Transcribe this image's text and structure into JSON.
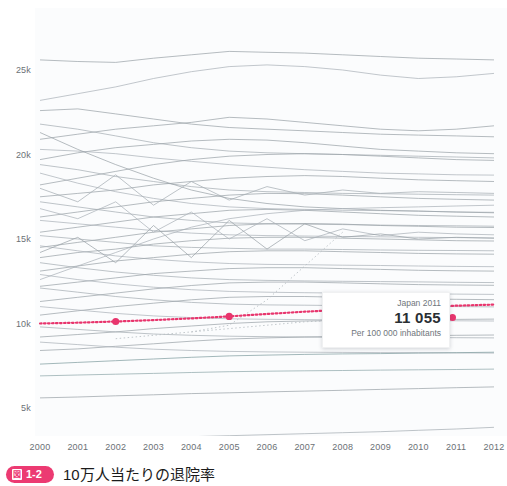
{
  "chart_data": {
    "type": "line",
    "title": "",
    "xlabel": "",
    "ylabel": "",
    "xlim": [
      2000,
      2012
    ],
    "ylim": [
      2000,
      26500
    ],
    "grid": false,
    "legend": false,
    "x": [
      2000,
      2001,
      2002,
      2003,
      2004,
      2005,
      2006,
      2007,
      2008,
      2009,
      2010,
      2011,
      2012
    ],
    "y_ticks": [
      {
        "label": "25k",
        "value": 25000
      },
      {
        "label": "20k",
        "value": 20000
      },
      {
        "label": "15k",
        "value": 15000
      },
      {
        "label": "10k",
        "value": 10000
      },
      {
        "label": "5k",
        "value": 5000
      }
    ],
    "x_ticks": [
      "2000",
      "2001",
      "2002",
      "2003",
      "2004",
      "2005",
      "2006",
      "2007",
      "2008",
      "2009",
      "2010",
      "2011",
      "2012"
    ],
    "highlight": {
      "name": "Japan",
      "color": "#e8356d",
      "style": "dotted",
      "values": [
        10000,
        10050,
        10120,
        10200,
        10300,
        10420,
        10560,
        10700,
        10810,
        10900,
        10980,
        11055,
        11120
      ]
    },
    "series": [
      {
        "name": "s1",
        "color": "#9aa2a8",
        "values": [
          25600,
          25500,
          25450,
          25700,
          25900,
          26100,
          26050,
          26000,
          25900,
          25800,
          25700,
          25650,
          25600
        ]
      },
      {
        "name": "s2",
        "color": "#aab2b8",
        "values": [
          23200,
          23600,
          24000,
          24500,
          24900,
          25200,
          25300,
          25200,
          25000,
          24700,
          24500,
          24600,
          24800
        ]
      },
      {
        "name": "s3",
        "color": "#9aa2a8",
        "values": [
          20900,
          21200,
          21500,
          21700,
          21900,
          22200,
          22100,
          21900,
          21700,
          21500,
          21400,
          21500,
          21700
        ]
      },
      {
        "name": "s4",
        "color": "#a5adb3",
        "values": [
          21800,
          21500,
          21100,
          20700,
          20400,
          20200,
          20100,
          20050,
          20000,
          19950,
          19900,
          19850,
          19800
        ]
      },
      {
        "name": "s5",
        "color": "#9aa2a8",
        "values": [
          19700,
          20100,
          20400,
          20600,
          20800,
          20900,
          20850,
          20700,
          20500,
          20300,
          20200,
          20100,
          20050
        ]
      },
      {
        "name": "s6",
        "color": "#aab2b8",
        "values": [
          20300,
          20200,
          20050,
          19800,
          19600,
          19400,
          19250,
          19100,
          19000,
          18900,
          18850,
          18800,
          18780
        ]
      },
      {
        "name": "s7",
        "color": "#9aa2a8",
        "values": [
          18200,
          18600,
          19000,
          19400,
          19700,
          19900,
          20000,
          20050,
          20000,
          19900,
          19800,
          19700,
          19650
        ]
      },
      {
        "name": "s8",
        "color": "#a5adb3",
        "values": [
          19400,
          19100,
          18700,
          18400,
          18100,
          17900,
          17800,
          17750,
          17700,
          17680,
          17650,
          17620,
          17600
        ]
      },
      {
        "name": "s9",
        "color": "#9aa2a8",
        "values": [
          17500,
          17700,
          17900,
          18200,
          18400,
          18600,
          18700,
          18750,
          18700,
          18600,
          18500,
          18450,
          18400
        ]
      },
      {
        "name": "s10",
        "color": "#aab2b8",
        "values": [
          18900,
          18300,
          17800,
          17400,
          17100,
          16900,
          16800,
          16750,
          16700,
          16680,
          16650,
          16600,
          16580
        ]
      },
      {
        "name": "s11",
        "color": "#9aa2a8",
        "values": [
          16300,
          16600,
          16900,
          17200,
          17400,
          17600,
          17700,
          17680,
          17600,
          17500,
          17400,
          17350,
          17300
        ]
      },
      {
        "name": "s12",
        "color": "#a5adb3",
        "values": [
          17200,
          16900,
          16600,
          16300,
          16100,
          15950,
          15900,
          15880,
          15850,
          15820,
          15800,
          15780,
          15760
        ]
      },
      {
        "name": "s13",
        "color": "#9aa2a8",
        "values": [
          15400,
          15700,
          16000,
          16300,
          16500,
          16700,
          16750,
          16700,
          16600,
          16500,
          16400,
          16350,
          16300
        ]
      },
      {
        "name": "s14",
        "color": "#aab2b8",
        "values": [
          16100,
          15900,
          15700,
          15500,
          15350,
          15250,
          15200,
          15180,
          15150,
          15130,
          15100,
          15080,
          15060
        ]
      },
      {
        "name": "s15",
        "color": "#9aa2a8",
        "values": [
          14500,
          14800,
          15100,
          15400,
          15600,
          15800,
          15900,
          15920,
          15880,
          15800,
          15750,
          15700,
          15680
        ]
      },
      {
        "name": "s16",
        "color": "#a5adb3",
        "values": [
          15200,
          15000,
          14800,
          14600,
          14500,
          14450,
          14400,
          14400,
          14380,
          14350,
          14330,
          14320,
          14300
        ]
      },
      {
        "name": "s17",
        "color": "#9aa2a8",
        "values": [
          13900,
          14200,
          14400,
          14700,
          14900,
          15050,
          15100,
          15100,
          15050,
          15000,
          14950,
          14900,
          14880
        ]
      },
      {
        "name": "s18",
        "color": "#aab2b8",
        "values": [
          14600,
          14300,
          14000,
          13800,
          13650,
          13550,
          13500,
          13480,
          13450,
          13430,
          13400,
          13380,
          13360
        ]
      },
      {
        "name": "s19",
        "color": "#9aa2a8",
        "values": [
          13100,
          13400,
          13700,
          13900,
          14100,
          14250,
          14300,
          14300,
          14250,
          14200,
          14150,
          14120,
          14100
        ]
      },
      {
        "name": "s20",
        "color": "#a5adb3",
        "values": [
          13600,
          13300,
          13050,
          12850,
          12700,
          12600,
          12550,
          12520,
          12500,
          12480,
          12460,
          12440,
          12420
        ]
      },
      {
        "name": "s21",
        "color": "#9aa2a8",
        "values": [
          12200,
          12450,
          12700,
          12950,
          13100,
          13250,
          13300,
          13300,
          13250,
          13200,
          13150,
          13120,
          13100
        ]
      },
      {
        "name": "s22",
        "color": "#aab2b8",
        "values": [
          12900,
          12600,
          12350,
          12150,
          12000,
          11900,
          11850,
          11820,
          11800,
          11780,
          11760,
          11740,
          11720
        ]
      },
      {
        "name": "s23",
        "color": "#9aa2a8",
        "values": [
          11300,
          11550,
          11800,
          12050,
          12250,
          12400,
          12450,
          12450,
          12400,
          12350,
          12300,
          12280,
          12260
        ]
      },
      {
        "name": "s24",
        "color": "#a5adb3",
        "values": [
          12100,
          11850,
          11600,
          11400,
          11250,
          11150,
          11100,
          11080,
          11060,
          11040,
          11020,
          11000,
          10980
        ]
      },
      {
        "name": "s25",
        "color": "#9aa2a8",
        "values": [
          10500,
          10750,
          11000,
          11200,
          11400,
          11550,
          11600,
          11600,
          11550,
          11500,
          11450,
          11430,
          11410
        ]
      },
      {
        "name": "s26",
        "color": "#aab2b8",
        "values": [
          11000,
          10800,
          10600,
          10450,
          10350,
          10280,
          10250,
          10230,
          10210,
          10190,
          10170,
          10160,
          10150
        ]
      },
      {
        "name": "s27",
        "color": "#9aa2a8",
        "values": [
          9200,
          9350,
          9500,
          9700,
          9850,
          10000,
          10100,
          10150,
          10180,
          10200,
          10220,
          10240,
          10260
        ]
      },
      {
        "name": "s28",
        "color": "#a5adb3",
        "values": [
          9800,
          9650,
          9500,
          9380,
          9300,
          9250,
          9220,
          9200,
          9190,
          9180,
          9170,
          9160,
          9150
        ]
      },
      {
        "name": "s29",
        "color": "#9aa2a8",
        "values": [
          8400,
          8500,
          8650,
          8800,
          8950,
          9080,
          9150,
          9200,
          9230,
          9250,
          9280,
          9300,
          9320
        ]
      },
      {
        "name": "s30",
        "color": "#aab2b8",
        "values": [
          8900,
          8750,
          8600,
          8480,
          8400,
          8350,
          8320,
          8300,
          8290,
          8280,
          8270,
          8260,
          8250
        ]
      },
      {
        "name": "s31",
        "color": "#7f9ca0",
        "values": [
          7600,
          7700,
          7800,
          7900,
          8000,
          8080,
          8130,
          8170,
          8200,
          8220,
          8250,
          8270,
          8300
        ]
      },
      {
        "name": "s32",
        "color": "#8fa7aa",
        "values": [
          6900,
          6950,
          7000,
          7050,
          7100,
          7150,
          7180,
          7200,
          7220,
          7240,
          7260,
          7280,
          7300
        ]
      },
      {
        "name": "s33",
        "color": "#9aa2a8",
        "values": [
          5600,
          5650,
          5720,
          5780,
          5850,
          5900,
          5950,
          6000,
          6050,
          6100,
          6150,
          6200,
          6250
        ]
      },
      {
        "name": "s34",
        "color": "#a5adb3",
        "values": [
          3100,
          3150,
          3200,
          3250,
          3300,
          3360,
          3420,
          3480,
          3540,
          3600,
          3680,
          3760,
          3860
        ]
      },
      {
        "name": "s35",
        "color": "#9aa2a8",
        "values": [
          22600,
          22700,
          22400,
          22100,
          21800,
          21600,
          21500,
          21400,
          21300,
          21200,
          21150,
          21100,
          21050
        ]
      },
      {
        "name": "s36",
        "color": "#aab2b8",
        "values": [
          16800,
          16200,
          17200,
          15400,
          16600,
          15000,
          16200,
          14900,
          15600,
          15200,
          15400,
          15300,
          15250
        ]
      },
      {
        "name": "s37",
        "color": "#9aa2a8",
        "values": [
          14200,
          15100,
          13600,
          15800,
          13900,
          16100,
          14400,
          15900,
          15100,
          15300,
          15000,
          15100,
          15050
        ]
      },
      {
        "name": "s38",
        "color": "#a5adb3",
        "values": [
          18000,
          17200,
          18800,
          17000,
          18400,
          17300,
          18100,
          17600,
          17900,
          17700,
          17800,
          17750,
          17700
        ]
      },
      {
        "name": "s39",
        "color": "#9aa2a8",
        "values": [
          21300,
          20300,
          19400,
          18600,
          17900,
          17400,
          17100,
          16900,
          16800,
          16700,
          16650,
          16600,
          16550
        ]
      },
      {
        "name": "s40",
        "color": "#aab2b8",
        "values": [
          12600,
          13400,
          14200,
          15000,
          15700,
          16200,
          16500,
          16700,
          16800,
          16850,
          16900,
          16950,
          17000
        ]
      }
    ],
    "dashed_series": [
      {
        "name": "d1",
        "color": "#b7bec3",
        "values": [
          null,
          null,
          null,
          null,
          9500,
          9900,
          11400,
          13400,
          15400,
          null,
          null,
          null,
          null
        ]
      },
      {
        "name": "d2",
        "color": "#b7bec3",
        "values": [
          null,
          null,
          9100,
          9300,
          9500,
          9700,
          9900,
          10100,
          10200,
          null,
          null,
          null,
          null
        ]
      }
    ]
  },
  "tooltip": {
    "title": "Japan 2011",
    "value": "11 055",
    "subtitle": "Per 100 000 inhabitants"
  },
  "caption": {
    "badge_kanji": "図",
    "badge_number": "1-2",
    "text": "10万人当たりの退院率"
  }
}
